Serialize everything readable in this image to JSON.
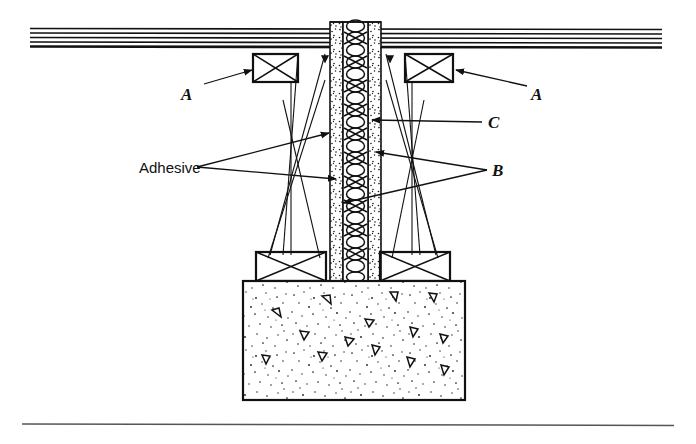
{
  "figure": {
    "background_color": "#ffffff",
    "ink_color": "#111111",
    "width": 696,
    "height": 444
  },
  "labels": {
    "a_left": "A",
    "a_right": "A",
    "b": "B",
    "c": "C",
    "adhesive": "Adhesive"
  },
  "components": {
    "top_slab": {
      "name": "layered horizontal slab",
      "line_count": 5,
      "x_start": 30,
      "x_end": 662,
      "y_top": 28,
      "y_bottom": 47
    },
    "upper_left_block": {
      "name": "X-braced bearing block A (left)",
      "x": 253,
      "y": 54,
      "w": 45,
      "h": 28
    },
    "upper_right_block": {
      "name": "X-braced bearing block A (right)",
      "x": 405,
      "y": 54,
      "w": 48,
      "h": 28
    },
    "lower_left_block": {
      "name": "X-braced bearing block (lower left)",
      "x": 256,
      "y": 252,
      "w": 70,
      "h": 29
    },
    "lower_right_block": {
      "name": "X-braced bearing block (lower right)",
      "x": 380,
      "y": 252,
      "w": 70,
      "h": 29
    },
    "core_column": {
      "name": "masonry core column C",
      "x_left": 330,
      "x_right": 381,
      "y_top": 22,
      "y_bottom": 281,
      "fill_pattern": "stone-rubble"
    },
    "adhesive_layers": {
      "name": "stippled adhesive layers B",
      "left_x": 330,
      "right_x": 368,
      "width": 13,
      "fill_pattern": "stipple"
    },
    "concrete_footing": {
      "name": "concrete footing with aggregate",
      "x": 243,
      "y": 281,
      "w": 222,
      "h": 119,
      "fill_pattern": "aggregate-stipple"
    },
    "baseline_rule": {
      "name": "page baseline rule",
      "x_start": 22,
      "x_end": 674,
      "y": 424
    }
  },
  "label_positions": {
    "a_left": {
      "x": 181,
      "y": 86
    },
    "a_right": {
      "x": 531,
      "y": 86
    },
    "c": {
      "x": 488,
      "y": 120
    },
    "b": {
      "x": 492,
      "y": 167
    },
    "adhesive": {
      "x": 139,
      "y": 165
    }
  },
  "leaders": {
    "a_left_arrow_to": {
      "x": 252,
      "y": 70
    },
    "a_right_arrow_to": {
      "x": 455,
      "y": 70
    },
    "c_arrow_to": {
      "x": 372,
      "y": 120
    },
    "b_arrow_1_to": {
      "x": 374,
      "y": 152
    },
    "b_arrow_2_to": {
      "x": 341,
      "y": 202
    },
    "adhesive_arrow_1_to": {
      "x": 330,
      "y": 133
    },
    "adhesive_arrow_2_to": {
      "x": 337,
      "y": 178
    }
  }
}
